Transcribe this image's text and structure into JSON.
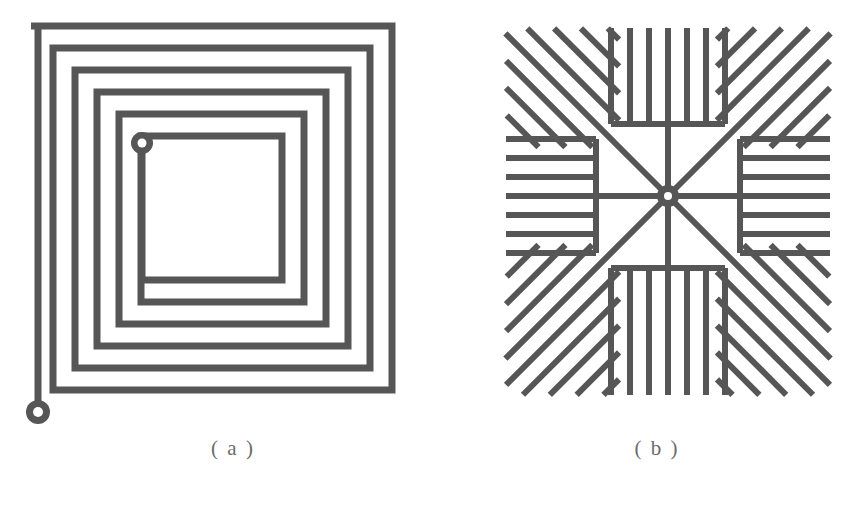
{
  "figure": {
    "background_color": "#ffffff",
    "stroke_color": "#565656",
    "panels": [
      {
        "key": "a",
        "caption": "( a )",
        "name": "square-spiral-planar-coil",
        "type": "square-spiral-coil",
        "turns": 6,
        "trace_width_px": 7,
        "pitch_px": 22,
        "outer_bbox_px": [
          31,
          26,
          392,
          390
        ],
        "inner_terminal": {
          "name": "inner-terminal-pad",
          "center_px": [
            142,
            143
          ],
          "pad_radius_px": 11,
          "hole_radius_px": 4.5
        },
        "outer_terminal": {
          "name": "outer-terminal-pad",
          "center_px": [
            38,
            412
          ],
          "pad_radius_px": 12,
          "hole_radius_px": 5
        }
      },
      {
        "key": "b",
        "caption": "( b )",
        "name": "radial-star-planar-coil",
        "type": "radial-star-coil",
        "spokes": 8,
        "orthogonal_spokes": 4,
        "diagonal_spokes": 4,
        "fingers_per_orthogonal_comb": 7,
        "fingers_per_diagonal_comb": 6,
        "trace_width_px": 6,
        "pitch_px": 19,
        "outer_bbox_px": [
          506,
          28,
          830,
          395
        ],
        "center_terminal": {
          "name": "center-terminal-pad",
          "center_px": [
            668,
            196
          ],
          "pad_radius_px": 11,
          "hole_radius_px": 4
        }
      }
    ]
  },
  "captions": {
    "a": "( a )",
    "b": "( b )"
  }
}
